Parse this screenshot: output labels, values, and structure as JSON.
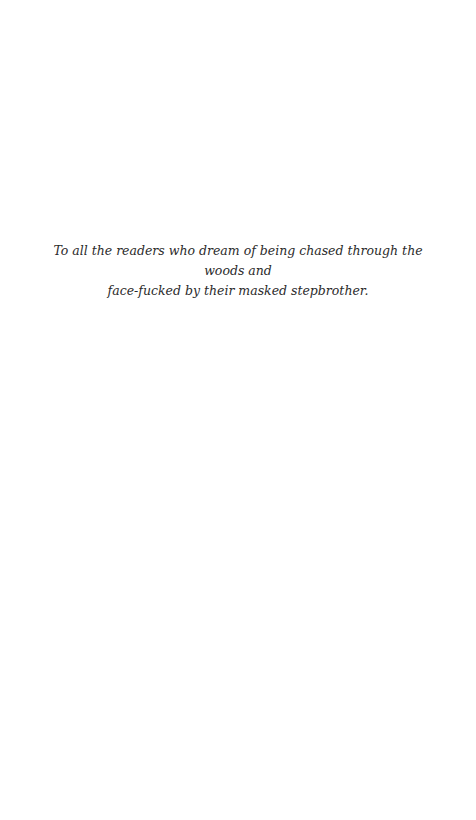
{
  "page": {
    "type": "dedication",
    "lines": [
      "To all the readers who dream of being chased through the woods and",
      "face-fucked by their masked stepbrother."
    ]
  },
  "colors": {
    "background": "#ffffff",
    "text": "#2b2b2b"
  }
}
